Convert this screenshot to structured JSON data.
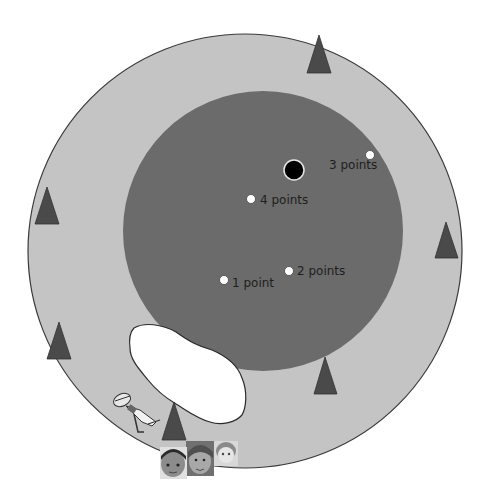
{
  "diagram": {
    "title": "",
    "colors": {
      "outer_field": "#c4c4c4",
      "outer_stroke": "#3a3a3a",
      "inner_zone": "#6b6b6b",
      "triangle": "#4a4a4a",
      "lake": "#ffffff",
      "target": "#000000",
      "marker": "#ffffff"
    },
    "outer_circle": {
      "cx": 245,
      "cy": 251,
      "r": 217
    },
    "inner_circle": {
      "cx": 263,
      "cy": 231,
      "r": 140
    },
    "center_target": {
      "cx": 294,
      "cy": 170,
      "r": 9
    },
    "markers": [
      {
        "id": "3pts",
        "cx": 370,
        "cy": 155,
        "label": "3 points",
        "lx": 329,
        "ly": 161
      },
      {
        "id": "4pts",
        "cx": 251,
        "cy": 199,
        "label": "4 points",
        "lx": 260,
        "ly": 193
      },
      {
        "id": "2pts",
        "cx": 289,
        "cy": 271,
        "label": "2 points",
        "lx": 297,
        "ly": 264
      },
      {
        "id": "1pt",
        "cx": 224,
        "cy": 280,
        "label": "1 point",
        "lx": 232,
        "ly": 276
      }
    ],
    "triangles": [
      {
        "name": "top",
        "points": "319,35 307,73 331,73"
      },
      {
        "name": "left-upper",
        "points": "47,187 35,224 59,224"
      },
      {
        "name": "right",
        "points": "446,222 435,258 458,258"
      },
      {
        "name": "left-lower",
        "points": "59,322 47,359 71,359"
      },
      {
        "name": "bottom-center",
        "points": "325,357 314,394 337,394"
      },
      {
        "name": "bottom-left",
        "points": "174,402 162,440 186,440"
      }
    ],
    "characters": {
      "explorer": "explorer-figure",
      "avatars": [
        "avatar-girl-dark-hair",
        "avatar-boy-curly-hair",
        "avatar-girl-red-hair"
      ]
    }
  }
}
